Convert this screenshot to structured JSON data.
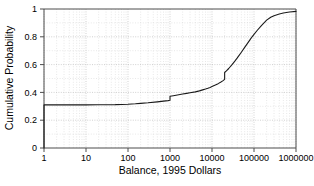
{
  "figure": {
    "background": "#ffffff",
    "ink_color": "#1a1a1a",
    "grid_color": "#d8d8d8",
    "axis_color": "#4d4d4d"
  },
  "chart_data": {
    "type": "line",
    "title": "",
    "subtitle": "",
    "xlabel": "Balance, 1995 Dollars",
    "ylabel": "Cumulative Probability",
    "xscale": "log",
    "yscale": "linear",
    "xlim": [
      1,
      1000000
    ],
    "ylim": [
      0,
      1
    ],
    "grid": true,
    "grid_style": "dotted",
    "legend": null,
    "legend_position": "none",
    "xticks": [
      1,
      10,
      100,
      1000,
      10000,
      100000,
      1000000
    ],
    "xticklabels": [
      "1",
      "10",
      "100",
      "1000",
      "10000",
      "100000",
      "1000000"
    ],
    "yticks": [
      0,
      0.2,
      0.4,
      0.6,
      0.8,
      1
    ],
    "yticklabels": [
      "0",
      "0.2",
      "0.4",
      "0.6",
      "0.8",
      "1"
    ],
    "series": [
      {
        "name": "Cumulative distribution of balance",
        "color": "#1a1a1a",
        "x": [
          1,
          1,
          2,
          5,
          10,
          20,
          50,
          100,
          150,
          200,
          300,
          500,
          700,
          900,
          1000,
          1000,
          1200,
          1500,
          2000,
          2500,
          3000,
          4000,
          5000,
          6000,
          7000,
          8000,
          9000,
          10000,
          12000,
          14000,
          16000,
          18000,
          20000,
          20000,
          22000,
          25000,
          30000,
          35000,
          40000,
          50000,
          60000,
          70000,
          80000,
          90000,
          100000,
          120000,
          150000,
          200000,
          250000,
          300000,
          400000,
          500000,
          700000,
          1000000
        ],
        "y": [
          0.0,
          0.31,
          0.31,
          0.31,
          0.31,
          0.311,
          0.312,
          0.315,
          0.318,
          0.321,
          0.325,
          0.332,
          0.337,
          0.341,
          0.343,
          0.372,
          0.376,
          0.381,
          0.388,
          0.393,
          0.397,
          0.404,
          0.411,
          0.418,
          0.424,
          0.43,
          0.436,
          0.442,
          0.453,
          0.463,
          0.473,
          0.483,
          0.494,
          0.543,
          0.555,
          0.572,
          0.6,
          0.625,
          0.648,
          0.689,
          0.724,
          0.753,
          0.778,
          0.8,
          0.818,
          0.847,
          0.881,
          0.92,
          0.941,
          0.952,
          0.964,
          0.971,
          0.978,
          0.983
        ]
      }
    ]
  },
  "footnote": {
    "clipped_text": ""
  }
}
